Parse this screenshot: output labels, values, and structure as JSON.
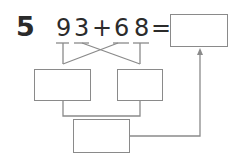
{
  "problem": {
    "number": "5",
    "expression": {
      "digits": [
        "9",
        "3",
        "+",
        "6",
        "8",
        "="
      ],
      "first_addend": "93",
      "operator": "+",
      "second_addend": "68",
      "equals": "="
    }
  },
  "boxes": {
    "answer": "",
    "tens_sum": "",
    "ones_sum": "",
    "total": ""
  },
  "colors": {
    "text": "#2b2b2b",
    "line": "#8a8a8a"
  }
}
